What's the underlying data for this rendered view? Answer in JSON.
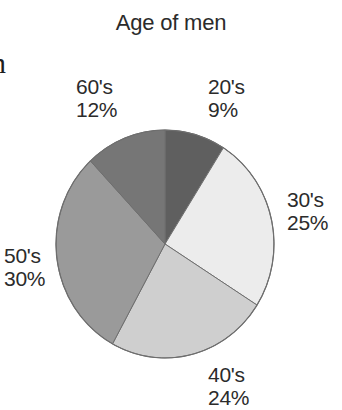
{
  "page": {
    "cropped_left_text": "n"
  },
  "chart_data": {
    "type": "pie",
    "title": "Age of men",
    "categories": [
      "20's",
      "30's",
      "40's",
      "50's",
      "60's"
    ],
    "values": [
      9,
      25,
      24,
      30,
      12
    ],
    "unit": "%",
    "labels": [
      {
        "category": "20's",
        "percent": "9%"
      },
      {
        "category": "30's",
        "percent": "25%"
      },
      {
        "category": "40's",
        "percent": "24%"
      },
      {
        "category": "50's",
        "percent": "30%"
      },
      {
        "category": "60's",
        "percent": "12%"
      }
    ],
    "colors": [
      "#5f5f5f",
      "#ececec",
      "#cfcfcf",
      "#9a9a9a",
      "#767676"
    ],
    "start_angle_deg": 0,
    "direction": "clockwise",
    "legend": "none",
    "border_color": "#6e6e6e"
  }
}
